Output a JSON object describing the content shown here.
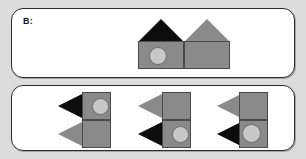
{
  "canvas": {
    "width": 306,
    "height": 159,
    "background_color": "#dcdcdc"
  },
  "colors": {
    "panel_background": "#ffffff",
    "panel_border": "#2b2b2b",
    "gray_fill": "#8a8a8a",
    "gray_fill_light": "#979797",
    "black_fill": "#0d0d0d",
    "circle_fill": "#c8c8c8",
    "shape_outline": "#4a4a4a",
    "label_color": "#111111"
  },
  "prompt_panel": {
    "label": "B:",
    "figures": [
      {
        "name": "house-left",
        "roof": {
          "shape": "triangle",
          "color": "black",
          "direction": "up"
        },
        "body": {
          "shape": "square",
          "color": "gray"
        },
        "marker": {
          "shape": "circle",
          "color": "light-gray",
          "present": true,
          "position": "center"
        }
      },
      {
        "name": "house-right",
        "roof": {
          "shape": "triangle",
          "color": "gray",
          "direction": "up"
        },
        "body": {
          "shape": "square",
          "color": "gray"
        },
        "marker": {
          "shape": "circle",
          "color": "light-gray",
          "present": false,
          "position": "none"
        }
      }
    ]
  },
  "options_panel": {
    "options": [
      {
        "name": "option-1",
        "index": 1,
        "top_unit": {
          "triangle": {
            "color": "black",
            "direction": "left"
          },
          "square": {
            "color": "gray"
          },
          "circle": {
            "present": true,
            "color": "light-gray",
            "position": "right"
          }
        },
        "bottom_unit": {
          "triangle": {
            "color": "gray",
            "direction": "left"
          },
          "square": {
            "color": "gray"
          },
          "circle": {
            "present": false,
            "color": "light-gray",
            "position": "none"
          }
        }
      },
      {
        "name": "option-2",
        "index": 2,
        "top_unit": {
          "triangle": {
            "color": "gray",
            "direction": "left"
          },
          "square": {
            "color": "gray"
          },
          "circle": {
            "present": false,
            "color": "light-gray",
            "position": "none"
          }
        },
        "bottom_unit": {
          "triangle": {
            "color": "black",
            "direction": "left"
          },
          "square": {
            "color": "gray"
          },
          "circle": {
            "present": true,
            "color": "light-gray",
            "position": "right"
          }
        }
      },
      {
        "name": "option-3",
        "index": 3,
        "top_unit": {
          "triangle": {
            "color": "gray",
            "direction": "left"
          },
          "square": {
            "color": "gray"
          },
          "circle": {
            "present": false,
            "color": "light-gray",
            "position": "none"
          }
        },
        "bottom_unit": {
          "triangle": {
            "color": "black",
            "direction": "left"
          },
          "square": {
            "color": "gray"
          },
          "circle": {
            "present": true,
            "color": "light-gray",
            "position": "left"
          }
        }
      }
    ]
  }
}
